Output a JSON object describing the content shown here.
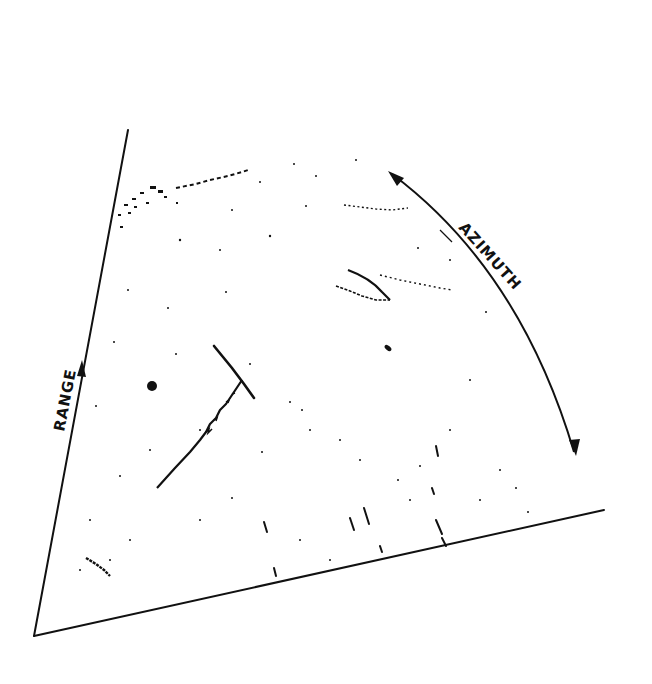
{
  "figure": {
    "type": "PPI radar display sector sketch",
    "background": "#ffffff",
    "ink": "#111111",
    "labels": {
      "range": "RANGE",
      "azimuth": "AZIMUTH"
    },
    "axes": {
      "range_axis": {
        "from": [
          34,
          636
        ],
        "to": [
          128,
          130
        ],
        "arrow_at": [
          82,
          368
        ]
      },
      "bottom_edge": {
        "from": [
          34,
          636
        ],
        "to": [
          604,
          510
        ]
      },
      "azimuth_arc": {
        "from": [
          392,
          174
        ],
        "to": [
          574,
          452
        ]
      }
    },
    "echoes": [
      {
        "name": "clutter-band-top",
        "center": [
          200,
          185
        ]
      },
      {
        "name": "clutter-band-upper-right",
        "center": [
          375,
          208
        ]
      },
      {
        "name": "v-shaped-echo",
        "center": [
          365,
          287
        ]
      },
      {
        "name": "streak-echo-right",
        "center": [
          420,
          287
        ]
      },
      {
        "name": "small-blob-right",
        "center": [
          388,
          348
        ]
      },
      {
        "name": "blob-left",
        "center": [
          152,
          386
        ]
      },
      {
        "name": "line-target-long",
        "center": [
          200,
          415
        ]
      },
      {
        "name": "line-target-cross",
        "center": [
          232,
          372
        ]
      },
      {
        "name": "clutter-lower-left",
        "center": [
          100,
          568
        ]
      },
      {
        "name": "clutter-bottom-streaks",
        "center": [
          380,
          530
        ]
      }
    ]
  }
}
